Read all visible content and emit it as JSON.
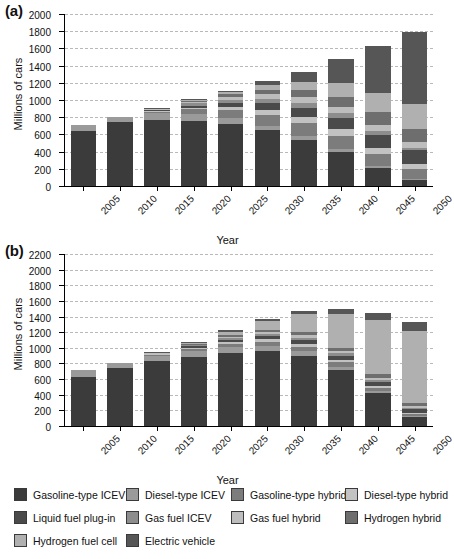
{
  "figure": {
    "panels": [
      {
        "label": "(a)",
        "name": "panel-a"
      },
      {
        "label": "(b)",
        "name": "panel-b"
      }
    ],
    "axis_titles": {
      "x": "Year",
      "y": "Millions of cars"
    }
  },
  "legend": {
    "position": "bottom",
    "entries": [
      {
        "label": "Gasoline-type ICEV",
        "color": "#3b3b3b"
      },
      {
        "label": "Diesel-type ICEV",
        "color": "#9a9a9a"
      },
      {
        "label": "Gasoline-type hybrid",
        "color": "#7c7c7c"
      },
      {
        "label": "Diesel-type hybrid",
        "color": "#c2c2c2"
      },
      {
        "label": "Liquid fuel plug-in",
        "color": "#4a4a4a"
      },
      {
        "label": "Gas fuel ICEV",
        "color": "#8d8d8d"
      },
      {
        "label": "Gas fuel hybrid",
        "color": "#bdbdbd"
      },
      {
        "label": "Hydrogen hybrid",
        "color": "#6e6e6e"
      },
      {
        "label": "Hydrogen fuel cell",
        "color": "#b0b0b0"
      },
      {
        "label": "Electric vehicle",
        "color": "#565656"
      }
    ]
  },
  "chart_data": [
    {
      "type": "bar",
      "name": "panel-a",
      "title": "(a)",
      "stacked": true,
      "xlabel": "Year",
      "ylabel": "Millions of cars",
      "ylim": [
        0,
        2000
      ],
      "ytick_step": 200,
      "yticks": [
        0,
        200,
        400,
        600,
        800,
        1000,
        1200,
        1400,
        1600,
        1800,
        2000
      ],
      "grid": true,
      "categories": [
        "2005",
        "2010",
        "2015",
        "2020",
        "2025",
        "2030",
        "2035",
        "2040",
        "2045",
        "2050"
      ],
      "series": [
        {
          "name": "Gasoline-type ICEV",
          "color": "#3b3b3b",
          "values": [
            645,
            740,
            770,
            755,
            720,
            650,
            540,
            400,
            215,
            75
          ]
        },
        {
          "name": "Diesel-type ICEV",
          "color": "#9a9a9a",
          "values": [
            70,
            65,
            75,
            85,
            70,
            50,
            40,
            30,
            20,
            10
          ]
        },
        {
          "name": "Gasoline-type hybrid",
          "color": "#7c7c7c",
          "values": [
            0,
            0,
            20,
            50,
            95,
            130,
            150,
            155,
            140,
            110
          ]
        },
        {
          "name": "Diesel-type hybrid",
          "color": "#c2c2c2",
          "values": [
            0,
            0,
            8,
            20,
            35,
            55,
            70,
            75,
            70,
            60
          ]
        },
        {
          "name": "Liquid fuel plug-in",
          "color": "#4a4a4a",
          "values": [
            0,
            0,
            10,
            25,
            45,
            75,
            105,
            130,
            150,
            160
          ]
        },
        {
          "name": "Gas fuel ICEV",
          "color": "#8d8d8d",
          "values": [
            0,
            0,
            12,
            25,
            40,
            55,
            60,
            55,
            45,
            30
          ]
        },
        {
          "name": "Gas fuel hybrid",
          "color": "#bdbdbd",
          "values": [
            0,
            0,
            5,
            15,
            30,
            50,
            65,
            75,
            75,
            65
          ]
        },
        {
          "name": "Hydrogen hybrid",
          "color": "#6e6e6e",
          "values": [
            0,
            0,
            5,
            15,
            30,
            55,
            85,
            115,
            140,
            150
          ]
        },
        {
          "name": "Hydrogen fuel cell",
          "color": "#b0b0b0",
          "values": [
            0,
            0,
            0,
            10,
            25,
            55,
            100,
            160,
            230,
            290
          ]
        },
        {
          "name": "Electric vehicle",
          "color": "#565656",
          "values": [
            0,
            0,
            5,
            10,
            20,
            45,
            110,
            280,
            540,
            840
          ]
        }
      ],
      "totals": [
        715,
        805,
        910,
        1010,
        1110,
        1220,
        1325,
        1470,
        1625,
        1790
      ]
    },
    {
      "type": "bar",
      "name": "panel-b",
      "title": "(b)",
      "stacked": true,
      "xlabel": "Year",
      "ylabel": "Millions of cars",
      "ylim": [
        0,
        2200
      ],
      "ytick_step": 200,
      "yticks": [
        0,
        200,
        400,
        600,
        800,
        1000,
        1200,
        1400,
        1600,
        1800,
        2000,
        2200
      ],
      "grid": true,
      "categories": [
        "2005",
        "2010",
        "2015",
        "2020",
        "2025",
        "2030",
        "2035",
        "2040",
        "2045",
        "2050"
      ],
      "series": [
        {
          "name": "Gasoline-type ICEV",
          "color": "#3b3b3b",
          "values": [
            630,
            745,
            830,
            880,
            930,
            960,
            900,
            720,
            420,
            110
          ]
        },
        {
          "name": "Diesel-type ICEV",
          "color": "#9a9a9a",
          "values": [
            85,
            60,
            70,
            80,
            75,
            65,
            55,
            40,
            25,
            12
          ]
        },
        {
          "name": "Gasoline-type hybrid",
          "color": "#7c7c7c",
          "values": [
            0,
            0,
            15,
            30,
            45,
            55,
            60,
            55,
            45,
            30
          ]
        },
        {
          "name": "Diesel-type hybrid",
          "color": "#c2c2c2",
          "values": [
            0,
            0,
            5,
            12,
            20,
            28,
            32,
            30,
            25,
            18
          ]
        },
        {
          "name": "Liquid fuel plug-in",
          "color": "#4a4a4a",
          "values": [
            0,
            0,
            8,
            18,
            30,
            42,
            50,
            55,
            50,
            42
          ]
        },
        {
          "name": "Gas fuel ICEV",
          "color": "#8d8d8d",
          "values": [
            0,
            0,
            6,
            14,
            22,
            30,
            34,
            32,
            26,
            18
          ]
        },
        {
          "name": "Gas fuel hybrid",
          "color": "#bdbdbd",
          "values": [
            0,
            0,
            4,
            10,
            18,
            25,
            30,
            30,
            26,
            20
          ]
        },
        {
          "name": "Hydrogen hybrid",
          "color": "#6e6e6e",
          "values": [
            0,
            0,
            4,
            10,
            18,
            28,
            36,
            42,
            44,
            40
          ]
        },
        {
          "name": "Hydrogen fuel cell",
          "color": "#b0b0b0",
          "values": [
            0,
            0,
            5,
            18,
            50,
            110,
            230,
            430,
            700,
            930
          ]
        },
        {
          "name": "Electric vehicle",
          "color": "#565656",
          "values": [
            0,
            0,
            3,
            8,
            17,
            32,
            48,
            66,
            89,
            110
          ]
        }
      ],
      "totals": [
        715,
        805,
        950,
        1080,
        1225,
        1375,
        1475,
        1500,
        1450,
        1330
      ]
    }
  ]
}
